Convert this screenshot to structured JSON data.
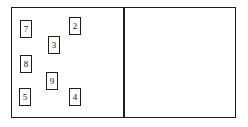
{
  "diagram": {
    "type": "floor-plan-marker-layout",
    "background_color": "#ffffff",
    "stroke_color": "#1d1d1d",
    "label_color": "#111111",
    "frame": {
      "name": "outer-frame",
      "x": 11,
      "y": 7,
      "width": 225,
      "height": 111
    },
    "divider": {
      "name": "vertical-divider",
      "x": 123,
      "y": 7,
      "width": 1.5,
      "height": 111
    },
    "panels": [
      {
        "name": "left-panel",
        "x": 12,
        "y": 8,
        "width": 111,
        "height": 109,
        "marker_count": 7
      },
      {
        "name": "right-panel",
        "x": 125,
        "y": 8,
        "width": 110,
        "height": 109,
        "marker_count": 0
      }
    ],
    "markers": [
      {
        "label": "7",
        "x": 20,
        "y": 20,
        "width": 12,
        "height": 18
      },
      {
        "label": "2",
        "x": 69,
        "y": 17,
        "width": 12,
        "height": 18
      },
      {
        "label": "3",
        "x": 48,
        "y": 36,
        "width": 12,
        "height": 18
      },
      {
        "label": "8",
        "x": 20,
        "y": 55,
        "width": 12,
        "height": 18
      },
      {
        "label": "9",
        "x": 46,
        "y": 72,
        "width": 12,
        "height": 18
      },
      {
        "label": "5",
        "x": 19,
        "y": 88,
        "width": 12,
        "height": 18
      },
      {
        "label": "4",
        "x": 69,
        "y": 88,
        "width": 12,
        "height": 18
      }
    ]
  }
}
